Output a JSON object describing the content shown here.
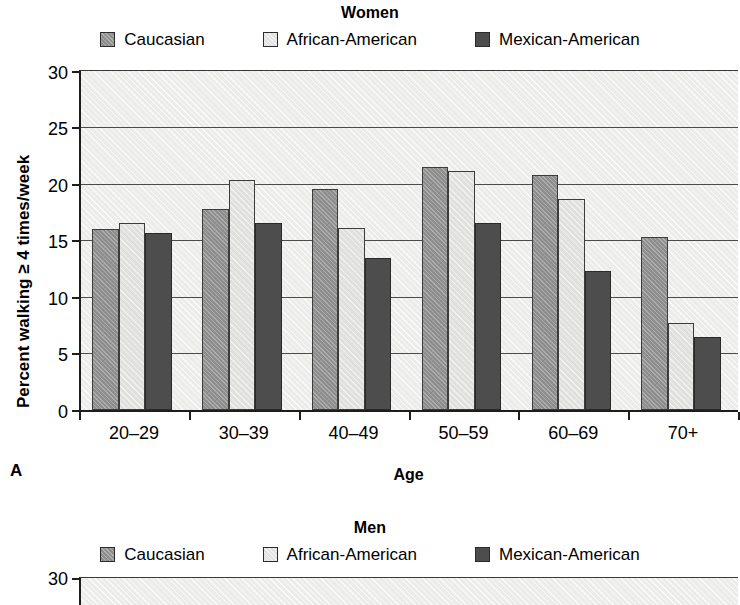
{
  "figure": {
    "panel_label_a": "A"
  },
  "panels": [
    {
      "id": "women",
      "title": "Women",
      "xlabel": "Age",
      "ylabel": "Percent walking ≥ 4 times/week",
      "legend": [
        {
          "label": "Caucasian",
          "swatch": "caucasian-swatch",
          "color": "#8d8d8d"
        },
        {
          "label": "African-American",
          "swatch": "african-american-swatch",
          "color": "#e0e0df"
        },
        {
          "label": "Mexican-American",
          "swatch": "mexican-american-swatch",
          "color": "#4d4d4d"
        }
      ],
      "yticks": [
        "0",
        "5",
        "10",
        "15",
        "20",
        "25",
        "30"
      ],
      "xticks": [
        "20–29",
        "30–39",
        "40–49",
        "50–59",
        "60–69",
        "70+"
      ]
    },
    {
      "id": "men",
      "title": "Men",
      "legend": [
        {
          "label": "Caucasian",
          "swatch": "caucasian-swatch",
          "color": "#8d8d8d"
        },
        {
          "label": "African-American",
          "swatch": "african-american-swatch",
          "color": "#e0e0df"
        },
        {
          "label": "Mexican-American",
          "swatch": "mexican-american-swatch",
          "color": "#4d4d4d"
        }
      ],
      "yticks": [
        "30"
      ]
    }
  ],
  "chart_data": [
    {
      "type": "bar",
      "title": "Women",
      "xlabel": "Age",
      "ylabel": "Percent walking ≥ 4 times/week",
      "categories": [
        "20–29",
        "30–39",
        "40–49",
        "50–59",
        "60–69",
        "70+"
      ],
      "series": [
        {
          "name": "Caucasian",
          "color": "#8d8d8d",
          "values": [
            15.9,
            17.6,
            19.4,
            21.3,
            20.6,
            15.2
          ]
        },
        {
          "name": "African-American",
          "color": "#e0e0df",
          "values": [
            16.4,
            20.2,
            16.0,
            21.0,
            18.5,
            7.6
          ]
        },
        {
          "name": "Mexican-American",
          "color": "#4d4d4d",
          "values": [
            15.5,
            16.4,
            13.3,
            16.4,
            12.2,
            6.4
          ]
        }
      ],
      "ylim": [
        0,
        30
      ],
      "yticks": [
        0,
        5,
        10,
        15,
        20,
        25,
        30
      ],
      "grid": true,
      "legend_position": "top"
    },
    {
      "type": "bar",
      "title": "Men",
      "note": "Chart cropped at bottom edge of screenshot; only title, legend and topmost y-axis tick (30) visible.",
      "categories": [],
      "series": [
        {
          "name": "Caucasian",
          "color": "#8d8d8d",
          "values": []
        },
        {
          "name": "African-American",
          "color": "#e0e0df",
          "values": []
        },
        {
          "name": "Mexican-American",
          "color": "#4d4d4d",
          "values": []
        }
      ],
      "ylim": [
        0,
        30
      ],
      "yticks": [
        30
      ],
      "grid": true,
      "legend_position": "top"
    }
  ]
}
